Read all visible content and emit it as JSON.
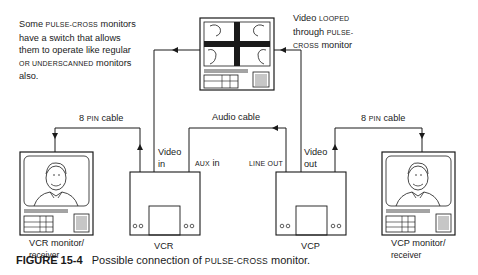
{
  "note": {
    "line1_a": "Some ",
    "line1_sc": "PULSE-CROSS",
    "line1_b": " monitors",
    "line2": "have a switch that allows",
    "line3": "them to operate like regular",
    "line4_sc": "OR UNDERSCANNED",
    "line4_b": " monitors",
    "line5": "also."
  },
  "loop_note": {
    "line1_a": "Video ",
    "line1_sc": "LOOPED",
    "line2_a": "through ",
    "line2_sc": "PULSE-",
    "line3_sc": "CROSS",
    "line3_b": " monitor"
  },
  "cables": {
    "left": {
      "a": "8 ",
      "sc": "PIN",
      "b": " cable"
    },
    "audio": "Audio cable",
    "right": {
      "a": "8 ",
      "sc": "PIN",
      "b": " cable"
    }
  },
  "ports": {
    "vcr_video_in": [
      "Video",
      "in"
    ],
    "vcr_aux_in": {
      "sc": "AUX",
      "b": " in"
    },
    "vcp_line_out": "LINE OUT",
    "vcp_video_out": [
      "Video",
      "out"
    ]
  },
  "devices": {
    "vcr_monitor": [
      "VCR monitor/",
      "receiver"
    ],
    "vcr": "VCR",
    "vcp": "VCP",
    "vcp_monitor": [
      "VCP monitor/",
      "receiver"
    ]
  },
  "caption": {
    "figure": "FIGURE 15-4",
    "text_a": "Possible connection of ",
    "text_sc": "PULSE-CROSS",
    "text_b": " monitor."
  }
}
